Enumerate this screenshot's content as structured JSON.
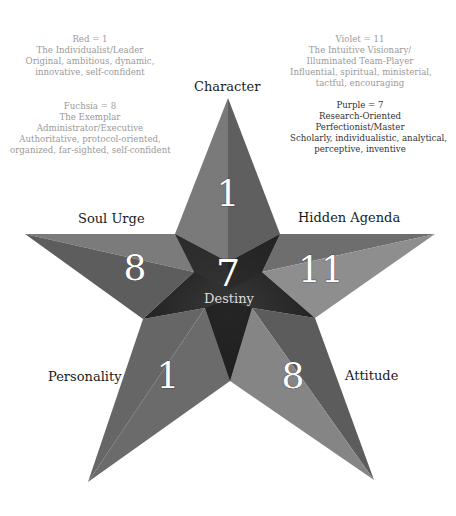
{
  "legend": [
    {
      "title": "Red = 1",
      "lines": [
        "The Individualist/Leader",
        "Original, ambitious, dynamic,",
        "innovative, self-confident"
      ],
      "style": "light"
    },
    {
      "title": "Fuchsia = 8",
      "lines": [
        "The Exemplar",
        "Administrator/Executive",
        "Authoritative, protocol-oriented,",
        "organized, far-sighted, self-confident"
      ],
      "style": "light"
    },
    {
      "title": "Violet = 11",
      "lines": [
        "The Intuitive Visionary/",
        "Illuminated Team-Player",
        "Influential, spiritual, ministerial,",
        "tactful, encouraging"
      ],
      "style": "light"
    },
    {
      "title": "Purple = 7",
      "lines": [
        "Research-Oriented",
        "Perfectionist/Master",
        "Scholarly, individualistic, analytical,",
        "perceptive, inventive"
      ],
      "style": "dark"
    }
  ],
  "star": {
    "points": [
      {
        "label": "Character",
        "value": "1"
      },
      {
        "label": "Hidden Agenda",
        "value": "11"
      },
      {
        "label": "Attitude",
        "value": "8"
      },
      {
        "label": "Personality",
        "value": "1"
      },
      {
        "label": "Soul Urge",
        "value": "8"
      }
    ],
    "center": {
      "label": "Destiny",
      "value": "7"
    }
  },
  "colors": {
    "background": "#ffffff",
    "star_light": "#8a8a8a",
    "star_mid": "#6f6f6f",
    "star_dark": "#555555",
    "center_dark": "#2b2b2b",
    "legend_text": "#9a9a9a"
  }
}
